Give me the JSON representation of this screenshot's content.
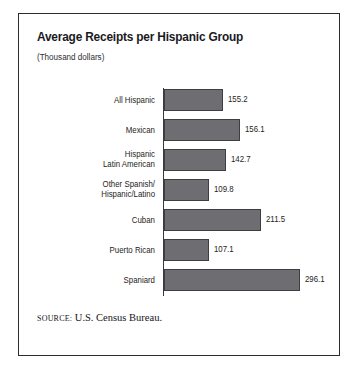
{
  "figure": {
    "title": "Average Receipts per Hispanic Group",
    "subtitle": "(Thousand dollars)",
    "source_label": "Source:",
    "source_text": "U.S. Census Bureau."
  },
  "chart_data": {
    "type": "bar",
    "orientation": "horizontal",
    "title": "Average Receipts per Hispanic Group",
    "subtitle": "(Thousand dollars)",
    "xlabel": "",
    "ylabel": "",
    "units": "Thousand dollars",
    "grid": false,
    "legend": false,
    "axis_line": "left",
    "bar_color": "#6e6e72",
    "bar_edge_color": "#3d3d42",
    "categories": [
      "All Hispanic",
      "Mexican",
      "Hispanic\nLatin American",
      "Other Spanish/\nHispanic/Latino",
      "Cuban",
      "Puerto Rican",
      "Spaniard"
    ],
    "values": [
      155.2,
      156.1,
      142.7,
      109.8,
      211.5,
      107.1,
      296.1
    ],
    "value_labels": [
      "155.2",
      "156.1",
      "142.7",
      "109.8",
      "211.5",
      "107.1",
      "296.1"
    ],
    "bars": [
      {
        "category_lines": [
          "All Hispanic"
        ],
        "value": 155.2,
        "label": "155.2",
        "bar_px": 59,
        "value_x_px": 209
      },
      {
        "category_lines": [
          "Mexican"
        ],
        "value": 156.1,
        "label": "156.1",
        "bar_px": 76,
        "value_x_px": 226
      },
      {
        "category_lines": [
          "Hispanic",
          "Latin American"
        ],
        "value": 142.7,
        "label": "142.7",
        "bar_px": 62,
        "value_x_px": 212
      },
      {
        "category_lines": [
          "Other Spanish/",
          "Hispanic/Latino"
        ],
        "value": 109.8,
        "label": "109.8",
        "bar_px": 45,
        "value_x_px": 195
      },
      {
        "category_lines": [
          "Cuban"
        ],
        "value": 211.5,
        "label": "211.5",
        "bar_px": 97,
        "value_x_px": 247
      },
      {
        "category_lines": [
          "Puerto Rican"
        ],
        "value": 107.1,
        "label": "107.1",
        "bar_px": 45,
        "value_x_px": 195
      },
      {
        "category_lines": [
          "Spaniard"
        ],
        "value": 296.1,
        "label": "296.1",
        "bar_px": 136,
        "value_x_px": 286
      }
    ]
  }
}
